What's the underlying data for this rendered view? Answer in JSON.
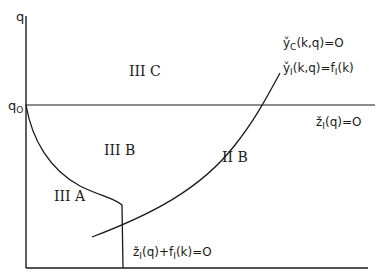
{
  "axes": {
    "y_label": "q",
    "q0_label": "q",
    "q0_sub": "O"
  },
  "regions": {
    "IIIC": "III C",
    "IIIB": "III B",
    "IIIA": "III A",
    "IIB": "II B"
  },
  "curves": {
    "yC": {
      "main": "y̌",
      "sub": "C",
      "rest": "(k,q)=O"
    },
    "yI": {
      "main": "y̌",
      "sub": "I",
      "rest": "(k,q)=f",
      "sub2": "I",
      "rest2": "(k)"
    },
    "zI": {
      "main": "ž",
      "sub": "I",
      "rest": "(q)=O"
    },
    "zIf": {
      "main": "ž",
      "sub": "I",
      "rest": "(q)+f",
      "sub2": "I",
      "rest2": "(k)=O"
    }
  },
  "colors": {
    "line": "#1a1a1a",
    "background": "#ffffff"
  }
}
